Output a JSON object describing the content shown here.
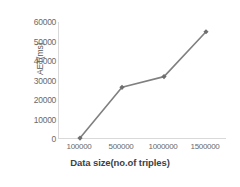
{
  "chart_data": {
    "type": "line",
    "title": "",
    "subtitle": "",
    "xlabel": "Data size(no.of triples)",
    "ylabel": "AET(ms)",
    "categories": [
      "100000",
      "500000",
      "1000000",
      "1500000"
    ],
    "values": [
      500,
      26500,
      32000,
      55000
    ],
    "series": [
      {
        "name": "AET",
        "values": [
          500,
          26500,
          32000,
          55000
        ]
      }
    ],
    "ylim": [
      0,
      60000
    ],
    "y_ticks": [
      "0",
      "10000",
      "20000",
      "30000",
      "40000",
      "50000",
      "60000"
    ],
    "y_tick_values": [
      0,
      10000,
      20000,
      30000,
      40000,
      50000,
      60000
    ],
    "grid": false,
    "legend": "none",
    "line_color": "#808080",
    "marker_color": "#6e6e6e",
    "marker": "diamond",
    "axis_color": "#d9d9d9",
    "background": "#ffffff"
  }
}
